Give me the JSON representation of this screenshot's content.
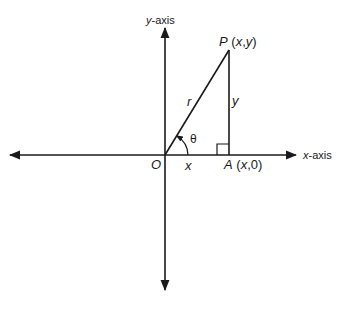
{
  "diagram": {
    "y_axis_label": {
      "var": "y",
      "suffix": "-axis"
    },
    "x_axis_label": {
      "var": "x",
      "suffix": "-axis"
    },
    "point_p": {
      "name": "P",
      "coords_open": " (",
      "x": "x",
      "comma": ",",
      "y": "y",
      "coords_close": ")"
    },
    "point_a": {
      "name": "A",
      "coords_open": " (",
      "x": "x",
      "rest": ",0)"
    },
    "origin": "O",
    "hypotenuse": "r",
    "vertical_side": "y",
    "horizontal_side": "x",
    "angle": "θ",
    "colors": {
      "line": "#1a1a1a",
      "background": "#ffffff"
    }
  }
}
